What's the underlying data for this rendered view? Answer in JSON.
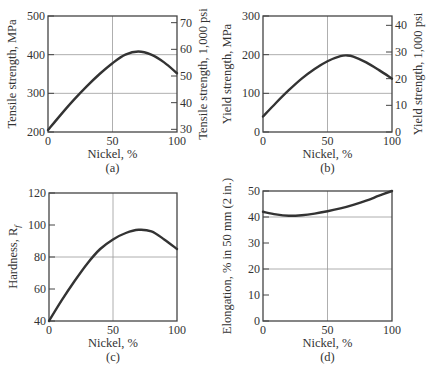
{
  "chart_data": [
    {
      "id": "a",
      "type": "line",
      "caption": "(a)",
      "xlabel": "Nickel, %",
      "ylabel": "Tensile strength, MPa",
      "ylabel_right": "Tensile strength, 1,000 psi",
      "xlim": [
        0,
        100
      ],
      "ylim": [
        200,
        500
      ],
      "ylim_right": [
        29,
        72.5
      ],
      "xticks": [
        0,
        50,
        100
      ],
      "yticks": [
        200,
        300,
        400,
        500
      ],
      "yticks_right": [
        30,
        40,
        50,
        60,
        70
      ],
      "grid": {
        "x": [
          50
        ],
        "y": [
          300,
          400
        ]
      },
      "x": [
        0,
        10,
        20,
        30,
        40,
        50,
        60,
        70,
        80,
        90,
        100
      ],
      "values": [
        205,
        245,
        283,
        318,
        350,
        378,
        400,
        408,
        400,
        380,
        352
      ]
    },
    {
      "id": "b",
      "type": "line",
      "caption": "(b)",
      "xlabel": "Nickel, %",
      "ylabel": "Yield strength, MPa",
      "ylabel_right": "Yield strength, 1,000 psi",
      "xlim": [
        0,
        100
      ],
      "ylim": [
        0,
        300
      ],
      "ylim_right": [
        0,
        43.5
      ],
      "xticks": [
        0,
        50,
        100
      ],
      "yticks": [
        0,
        100,
        200,
        300
      ],
      "yticks_right": [
        0,
        10,
        20,
        30,
        40
      ],
      "grid": {
        "x": [
          50
        ],
        "y": [
          100,
          200
        ]
      },
      "x": [
        0,
        10,
        20,
        30,
        40,
        50,
        60,
        65,
        70,
        80,
        90,
        100
      ],
      "values": [
        40,
        75,
        108,
        138,
        163,
        183,
        196,
        198,
        195,
        180,
        160,
        138
      ]
    },
    {
      "id": "c",
      "type": "line",
      "caption": "(c)",
      "xlabel": "Nickel, %",
      "ylabel": "Hardness, R",
      "ylabel_sub": "f",
      "xlim": [
        0,
        100
      ],
      "ylim": [
        40,
        120
      ],
      "xticks": [
        0,
        50,
        100
      ],
      "yticks": [
        40,
        60,
        80,
        100,
        120
      ],
      "grid": {
        "x": [
          50
        ],
        "y": [
          80
        ]
      },
      "x": [
        0,
        10,
        20,
        30,
        40,
        50,
        60,
        70,
        80,
        90,
        100
      ],
      "values": [
        40,
        53,
        65,
        76,
        85,
        91,
        95,
        97,
        96,
        91,
        85
      ]
    },
    {
      "id": "d",
      "type": "line",
      "caption": "(d)",
      "xlabel": "Nickel, %",
      "ylabel": "Elongation, % in 50 mm (2 in.)",
      "xlim": [
        0,
        100
      ],
      "ylim": [
        0,
        50
      ],
      "xticks": [
        0,
        50,
        100
      ],
      "yticks": [
        0,
        10,
        20,
        30,
        40,
        50
      ],
      "grid": {
        "x": [
          50
        ],
        "y": [
          20,
          40
        ]
      },
      "x": [
        0,
        10,
        20,
        30,
        40,
        50,
        60,
        70,
        80,
        90,
        100
      ],
      "values": [
        42,
        41,
        40.5,
        40.7,
        41.3,
        42.2,
        43.3,
        44.7,
        46.3,
        48.2,
        50
      ]
    }
  ],
  "panels": [
    {
      "box": {
        "left": 48,
        "top": 16,
        "right": 177,
        "bottom": 132
      },
      "right_axis": true
    },
    {
      "box": {
        "left": 263,
        "top": 16,
        "right": 392,
        "bottom": 132
      },
      "right_axis": true
    },
    {
      "box": {
        "left": 49,
        "top": 193,
        "right": 177,
        "bottom": 321
      },
      "right_axis": false
    },
    {
      "box": {
        "left": 263,
        "top": 191,
        "right": 392,
        "bottom": 321
      },
      "right_axis": false
    }
  ],
  "colors": {
    "curve": "#333333",
    "axis": "#444444",
    "grid": "#9a9a9a",
    "text": "#333333"
  }
}
